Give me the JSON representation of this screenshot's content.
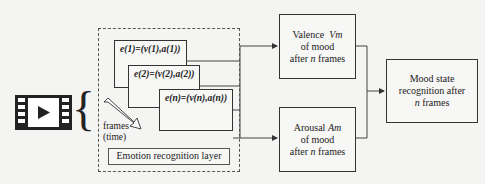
{
  "input": {
    "icon": "video-film-icon",
    "brace": "{"
  },
  "emotion_layer": {
    "frames": [
      {
        "label": "e(1)=(v(1),a(1))"
      },
      {
        "label": "e(2)=(v(2),a(2))"
      },
      {
        "label": "e(n)=(v(n),a(n))"
      }
    ],
    "arrow_label_line1": "frames",
    "arrow_label_line2": "(time)",
    "title": "Emotion recognition layer"
  },
  "valence": {
    "line1": "Valence",
    "symbol": "Vm",
    "line2": "of mood",
    "line3_pre": "after",
    "line3_n": "n",
    "line3_post": "frames"
  },
  "arousal": {
    "line1": "Arousal",
    "symbol": "Am",
    "line2": "of mood",
    "line3_pre": "after",
    "line3_n": "n",
    "line3_post": "frames"
  },
  "mood": {
    "line1": "Mood state",
    "line2": "recognition after",
    "line3_n": "n",
    "line3_post": "frames"
  },
  "colors": {
    "background": "#f4f4f2",
    "stroke": "#333333"
  }
}
